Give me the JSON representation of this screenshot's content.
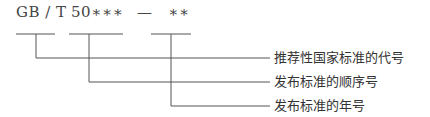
{
  "code": {
    "prefix": "GB / T",
    "number": "50∗∗∗",
    "dash": "—",
    "year": "∗∗"
  },
  "labels": [
    "推荐性国家标准的代号",
    "发布标准的顺序号",
    "发布标准的年号"
  ],
  "colors": {
    "line": "#555555",
    "text": "#333333"
  }
}
